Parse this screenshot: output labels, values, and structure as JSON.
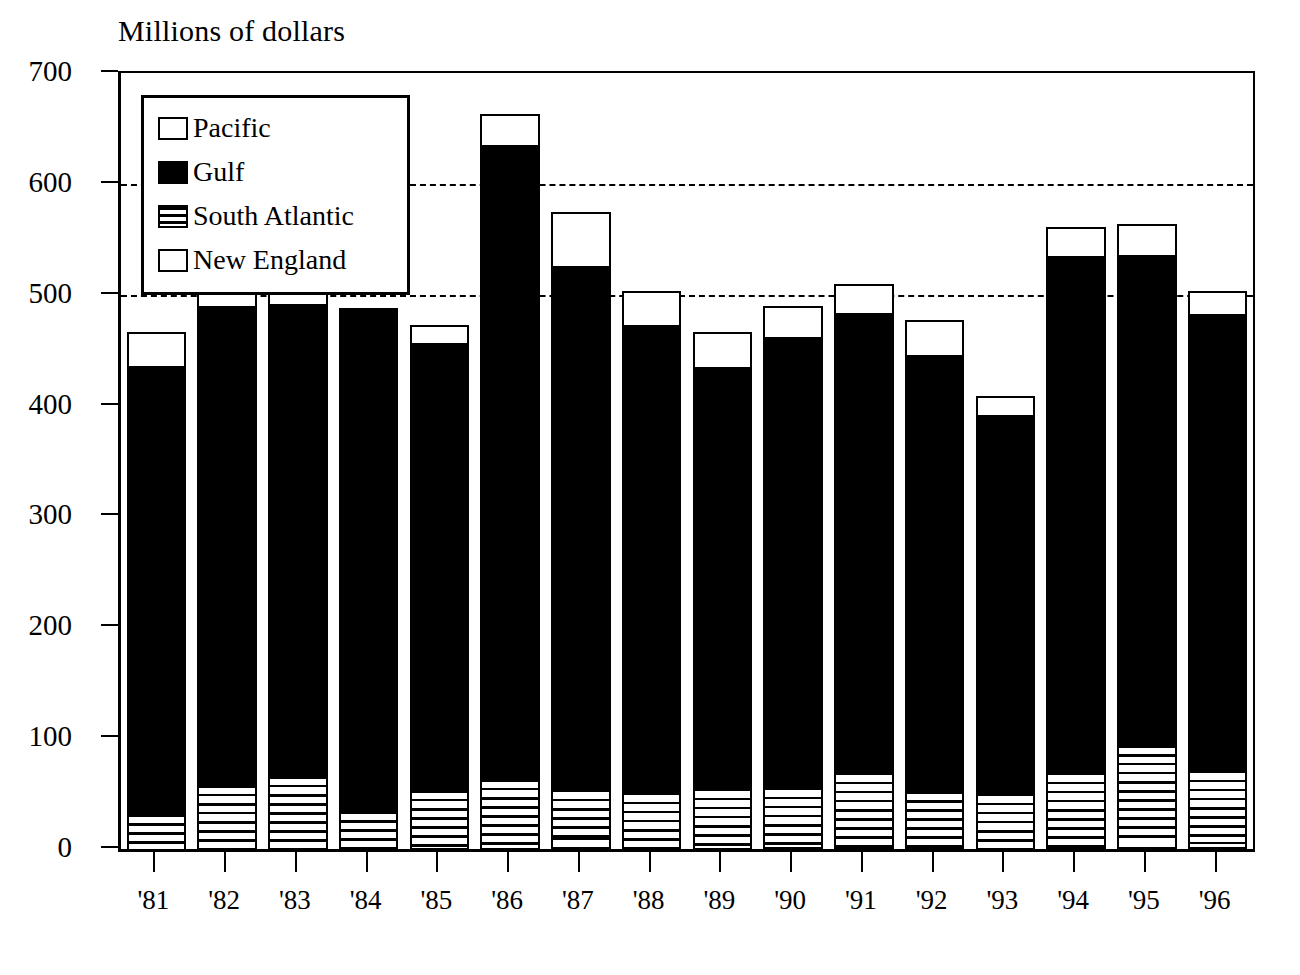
{
  "chart_data": {
    "type": "bar",
    "subtype": "stacked",
    "title": "Millions of dollars",
    "xlabel": "",
    "ylabel": "",
    "ylim": [
      0,
      700
    ],
    "ytick_step": 100,
    "yticks": [
      0,
      100,
      200,
      300,
      400,
      500,
      600,
      700
    ],
    "ytick_labels": [
      "0",
      "100",
      "200",
      "300",
      "400",
      "500",
      "600",
      "700"
    ],
    "gridlines_at": [
      500,
      600
    ],
    "grid": "dashed-horizontal-partial",
    "legend_position": "upper-left-inside",
    "categories": [
      "'81",
      "'82",
      "'83",
      "'84",
      "'85",
      "'86",
      "'87",
      "'88",
      "'89",
      "'90",
      "'91",
      "'92",
      "'93",
      "'94",
      "'95",
      "'96"
    ],
    "series": [
      {
        "name": "New England",
        "pattern": "white-outlined",
        "values": [
          0,
          0,
          1,
          1,
          1,
          1,
          10,
          2,
          1,
          2,
          2,
          2,
          1,
          2,
          12,
          6
        ]
      },
      {
        "name": "South Atlantic",
        "pattern": "horizontal-stripes",
        "values": [
          33,
          60,
          67,
          35,
          54,
          64,
          45,
          50,
          55,
          55,
          68,
          52,
          50,
          68,
          84,
          66
        ]
      },
      {
        "name": "Gulf",
        "pattern": "solid-black",
        "values": [
          401,
          428,
          422,
          448,
          400,
          568,
          469,
          419,
          377,
          403,
          412,
          390,
          339,
          463,
          438,
          409
        ]
      },
      {
        "name": "Pacific",
        "pattern": "checkerboard",
        "values": [
          32,
          20,
          13,
          4,
          18,
          30,
          51,
          32,
          33,
          30,
          28,
          33,
          19,
          28,
          30,
          22
        ]
      }
    ],
    "totals": [
      466,
      508,
      503,
      488,
      473,
      663,
      575,
      503,
      466,
      490,
      510,
      477,
      409,
      561,
      564,
      503
    ]
  },
  "legend": {
    "items": [
      {
        "label": "Pacific",
        "swatch": "pacific-swatch"
      },
      {
        "label": "Gulf",
        "swatch": "gulf-swatch"
      },
      {
        "label": "South Atlantic",
        "swatch": "south-atlantic-swatch"
      },
      {
        "label": "New England",
        "swatch": "new-england-swatch"
      }
    ]
  },
  "caption": {
    "text": ""
  }
}
